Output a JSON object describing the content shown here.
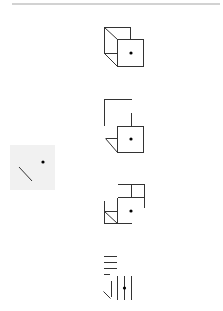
{
  "figure": {
    "type": "spatial-reasoning-puzzle",
    "colors": {
      "stroke": "#333333",
      "dot": "#000000",
      "reference_panel": "#f1f1f1",
      "top_rule": "#d2d2d2"
    },
    "reference": {
      "label": "reference-face",
      "marks": [
        "diagonal-line",
        "dot"
      ]
    },
    "options": [
      {
        "id": "option-1",
        "shape": "cube-view",
        "marks": [
          "dot"
        ]
      },
      {
        "id": "option-2",
        "shape": "partial-cube-view",
        "marks": [
          "dot",
          "triangle"
        ]
      },
      {
        "id": "option-3",
        "shape": "partial-cube-view",
        "marks": [
          "dot",
          "diagonal-line"
        ]
      },
      {
        "id": "option-4",
        "shape": "line-fragment-view",
        "marks": [
          "dot",
          "diagonal-line",
          "parallel-lines"
        ]
      }
    ]
  }
}
